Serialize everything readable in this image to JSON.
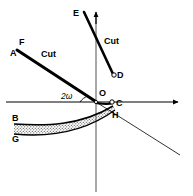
{
  "figure": {
    "background_color": "#ffffff",
    "ink_color": "#000000",
    "width": 193,
    "height": 196
  },
  "axes": {
    "origin_label": "O",
    "origin_x": 96,
    "origin_y": 102,
    "x_axis": {
      "name": "horizontal-axis",
      "from_x": 6,
      "to_x": 182,
      "y": 102,
      "arrow": "right"
    },
    "y_axis": {
      "name": "vertical-axis",
      "x": 96,
      "from_y": 192,
      "to_y": 10,
      "arrow": "up"
    }
  },
  "labels": [
    {
      "id": "F",
      "text": "F",
      "x": 19,
      "y": 41,
      "style": "point"
    },
    {
      "id": "A",
      "text": "A",
      "x": 11,
      "y": 52,
      "style": "point"
    },
    {
      "id": "E",
      "text": "E",
      "x": 74,
      "y": 12,
      "style": "point"
    },
    {
      "id": "D",
      "text": "D",
      "x": 117,
      "y": 76,
      "style": "point"
    },
    {
      "id": "O",
      "text": "O",
      "x": 99,
      "y": 92,
      "style": "point"
    },
    {
      "id": "C",
      "text": "C",
      "x": 117,
      "y": 104,
      "style": "point"
    },
    {
      "id": "H",
      "text": "H",
      "x": 113,
      "y": 115,
      "style": "point"
    },
    {
      "id": "B",
      "text": "B",
      "x": 13,
      "y": 118,
      "style": "point"
    },
    {
      "id": "G",
      "text": "G",
      "x": 13,
      "y": 139,
      "style": "point"
    },
    {
      "id": "cut-line",
      "text": "Cut",
      "x": 42,
      "y": 54,
      "style": "cut"
    },
    {
      "id": "cut-curve",
      "text": "Cut",
      "x": 105,
      "y": 41,
      "style": "cut"
    },
    {
      "id": "angle",
      "text": "2ω",
      "x": 62,
      "y": 95,
      "style": "angle"
    }
  ],
  "strokes": {
    "cut_line_AF": {
      "name": "cut-line-af",
      "description": "thick straight cut line from F/A down-right through origin",
      "path": "M 17 51 L 95 101",
      "width": 3
    },
    "cut_line_extension": {
      "name": "cut-line-extension",
      "description": "thin continuation of the cut line below and right of origin",
      "path": "M 96 102 L 180 155",
      "width": 0.8
    },
    "cut_curve_ED": {
      "name": "cut-curve-ed",
      "description": "thick curve from E near the y-axis top down to point D",
      "path": "M 85 13 C 95 34, 105 56, 114 74",
      "width": 2.6
    },
    "curve_OC": {
      "name": "curve-oc",
      "description": "short thick curve from origin up-right to C",
      "path": "M 96 102 C 104 103, 110 104, 113 102",
      "width": 2.2
    },
    "band_upper_BH": {
      "name": "band-upper-edge-bh",
      "description": "upper edge of stippled band, from B on the left curving up to H",
      "path": "M 14 124 C 45 126, 80 126, 113 106",
      "width": 1.6
    },
    "band_lower_GH": {
      "name": "band-lower-edge-gh",
      "description": "lower edge of stippled band, from G on the left curving up to H",
      "path": "M 14 134 C 45 137, 82 134, 115 109",
      "width": 1.6
    }
  },
  "markers": [
    {
      "name": "point-d-marker",
      "x": 114,
      "y": 75,
      "r": 2.2
    },
    {
      "name": "point-c-marker",
      "x": 113,
      "y": 102,
      "r": 2.2
    }
  ],
  "shading": {
    "name": "stippled-band",
    "pattern": "dotted-stipple",
    "between": [
      "B",
      "G"
    ],
    "fill_color": "#b8b8b8"
  }
}
